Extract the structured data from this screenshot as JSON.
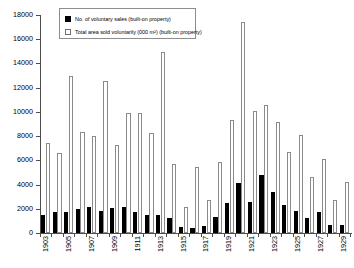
{
  "chart_data": {
    "type": "bar",
    "title": "",
    "xlabel": "",
    "ylabel": "",
    "ylim": [
      0,
      18000
    ],
    "ytick_step": 2000,
    "yticks": [
      0,
      2000,
      4000,
      6000,
      8000,
      10000,
      12000,
      14000,
      16000,
      18000
    ],
    "ytick_labels": [
      "0",
      "2000",
      "4000",
      "6000",
      "8000",
      "10000",
      "12000",
      "14000",
      "16000",
      "18000"
    ],
    "grid": false,
    "legend_position": "top-left-inside",
    "categories": [
      "1903",
      "1904",
      "1905",
      "1906",
      "1907",
      "1908",
      "1909",
      "1910",
      "1911",
      "1912",
      "1913",
      "1914",
      "1915",
      "1916",
      "1917",
      "1918",
      "1919",
      "1920",
      "1921",
      "1922",
      "1923",
      "1924",
      "1925",
      "1926",
      "1927",
      "1928",
      "1929"
    ],
    "xtick_labels_shown": [
      "1903",
      "1905",
      "1907",
      "1909",
      "1911",
      "1913",
      "1915",
      "1917",
      "1919",
      "1921",
      "1923",
      "1925",
      "1927",
      "1929"
    ],
    "series": [
      {
        "name": "No. of voluntary sales (built-on property)",
        "color": "#000000",
        "values": [
          1450,
          1750,
          1700,
          2000,
          2150,
          1800,
          2100,
          2150,
          1700,
          1500,
          1450,
          1200,
          500,
          400,
          550,
          1300,
          2450,
          4150,
          2550,
          4750,
          3400,
          2300,
          1800,
          1200,
          1750,
          700,
          650
        ]
      },
      {
        "name": "Total area sold voluntarily (000 m²) (built-on property)",
        "color": "#ffffff",
        "values": [
          7400,
          6600,
          12950,
          8300,
          8050,
          12550,
          7250,
          9950,
          9900,
          8250,
          14950,
          5700,
          2150,
          5450,
          2700,
          5900,
          9300,
          17400,
          10100,
          10600,
          9200,
          6700,
          8100,
          4650,
          6150,
          2750,
          4200
        ]
      }
    ]
  }
}
